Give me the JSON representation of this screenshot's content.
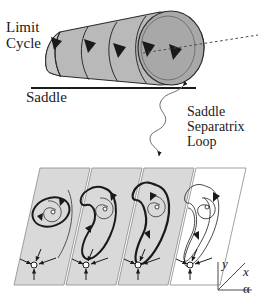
{
  "figure": {
    "background": "#ffffff",
    "ink": "#1a1a1a",
    "surface_fill": "#b9b9b9",
    "surface_fill_dark": "#9a9a9a",
    "panel_fill": "#d9d9d9",
    "panel_edge": "#8a8a8a",
    "width": 263,
    "height": 307
  },
  "labels": {
    "limit_cycle": "Limit\nCycle",
    "saddle": "Saddle",
    "saddle_separatrix_loop": "Saddle\nSeparatrix\nLoop"
  },
  "axes": {
    "y": "y",
    "x": "x",
    "alpha": "α"
  },
  "top_surface": {
    "name": "limit-cycle-cone",
    "description": "Shaded horn/cone swept by the family of limit cycles, widening left to right",
    "ring_count": 5,
    "arrowheads": 5,
    "dashed_axis": true,
    "baseline": "Saddle"
  },
  "panels": [
    {
      "id": 1,
      "name": "phase-plane-1",
      "shaded": true,
      "limit_cycle": "small",
      "limit_cycle_bold": true,
      "touches_saddle": false,
      "focus": "unstable-focus",
      "saddle": "saddle-point",
      "spiral_arrows": 2
    },
    {
      "id": 2,
      "name": "phase-plane-2",
      "shaded": true,
      "limit_cycle": "grown",
      "limit_cycle_bold": true,
      "touches_saddle": false,
      "focus": "unstable-focus",
      "saddle": "saddle-point",
      "spiral_arrows": 2
    },
    {
      "id": 3,
      "name": "phase-plane-3",
      "shaded": true,
      "limit_cycle": "homoclinic-loop",
      "limit_cycle_bold": true,
      "touches_saddle": true,
      "focus": "unstable-focus",
      "saddle": "saddle-point",
      "spiral_arrows": 2
    },
    {
      "id": 4,
      "name": "phase-plane-4",
      "shaded": false,
      "limit_cycle": "broken",
      "limit_cycle_bold": false,
      "touches_saddle": false,
      "focus": "unstable-focus",
      "saddle": "saddle-point",
      "spiral_arrows": 2
    }
  ],
  "leader": {
    "name": "squiggle-leader",
    "from": "cone-base",
    "to": "phase-plane-3-loop",
    "arrowheads": 2
  }
}
